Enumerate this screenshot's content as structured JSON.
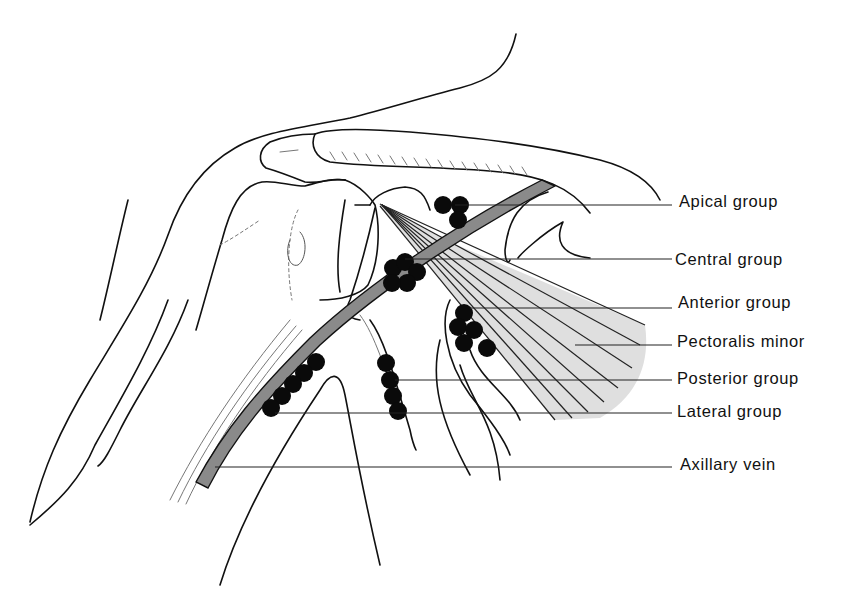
{
  "figure": {
    "labels": [
      {
        "id": "apical",
        "text": "Apical group",
        "x": 679,
        "y": 192,
        "leader_y": 205,
        "leader_x1": 455
      },
      {
        "id": "central",
        "text": "Central group",
        "x": 675,
        "y": 250,
        "leader_y": 259,
        "leader_x1": 405
      },
      {
        "id": "anterior",
        "text": "Anterior group",
        "x": 678,
        "y": 292,
        "leader_y": 308,
        "leader_x1": 470
      },
      {
        "id": "pectoralis",
        "text": "Pectoralis minor",
        "x": 677,
        "y": 331,
        "leader_y": 345,
        "leader_x1": 575
      },
      {
        "id": "posterior",
        "text": "Posterior group",
        "x": 677,
        "y": 368,
        "leader_y": 380,
        "leader_x1": 395
      },
      {
        "id": "lateral",
        "text": "Lateral group",
        "x": 677,
        "y": 402,
        "leader_y": 413,
        "leader_x1": 275
      },
      {
        "id": "vein",
        "text": "Axillary vein",
        "x": 680,
        "y": 455,
        "leader_y": 467,
        "leader_x1": 215
      }
    ]
  },
  "colors": {
    "line": "#111111",
    "vein": "#8a8a8a",
    "muscle": "#d6d6d6",
    "node": "#0a0a0a",
    "background": "#ffffff"
  }
}
